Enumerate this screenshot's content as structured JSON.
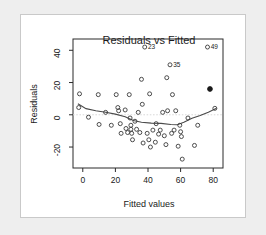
{
  "chart_data": {
    "type": "scatter",
    "title": "Residuals vs Fitted",
    "xlabel": "Fitted values",
    "ylabel": "Residuals",
    "xlim": [
      -6,
      86
    ],
    "ylim": [
      -33,
      47
    ],
    "xticks": [
      0,
      20,
      40,
      60,
      80
    ],
    "xticklabels": [
      "0",
      "20",
      "40",
      "60",
      "80"
    ],
    "yticks": [
      -20,
      0,
      20,
      40
    ],
    "yticklabels": [
      "-20",
      "0",
      "20",
      "40"
    ],
    "grid": false,
    "legend": null,
    "zero_reference_line": 0,
    "points": [
      {
        "x": -2.0,
        "y": 13.0
      },
      {
        "x": -2.5,
        "y": 4.5
      },
      {
        "x": 3.5,
        "y": -1.5
      },
      {
        "x": 9.5,
        "y": 12.5
      },
      {
        "x": 10.0,
        "y": -6.0
      },
      {
        "x": 14.0,
        "y": 1.5
      },
      {
        "x": 17.5,
        "y": -6.5
      },
      {
        "x": 20.5,
        "y": 12.5
      },
      {
        "x": 21.5,
        "y": 4.5
      },
      {
        "x": 22.0,
        "y": 2.5
      },
      {
        "x": 23.0,
        "y": -5.5
      },
      {
        "x": 23.5,
        "y": -11.5
      },
      {
        "x": 26.0,
        "y": 3.0
      },
      {
        "x": 26.5,
        "y": -8.5
      },
      {
        "x": 27.5,
        "y": -11.0
      },
      {
        "x": 28.5,
        "y": 12.5
      },
      {
        "x": 29.0,
        "y": -2.0
      },
      {
        "x": 29.5,
        "y": -6.5
      },
      {
        "x": 29.5,
        "y": -9.0
      },
      {
        "x": 30.0,
        "y": -11.5
      },
      {
        "x": 30.5,
        "y": -15.5
      },
      {
        "x": 32.0,
        "y": -4.0
      },
      {
        "x": 33.0,
        "y": -9.0
      },
      {
        "x": 34.0,
        "y": 1.5
      },
      {
        "x": 35.0,
        "y": -11.0
      },
      {
        "x": 36.0,
        "y": 22.0
      },
      {
        "x": 36.5,
        "y": 6.5
      },
      {
        "x": 37.0,
        "y": -17.5
      },
      {
        "x": 38.0,
        "y": 42.0
      },
      {
        "x": 39.5,
        "y": -11.5
      },
      {
        "x": 40.5,
        "y": -15.5
      },
      {
        "x": 41.0,
        "y": 13.0
      },
      {
        "x": 41.5,
        "y": -20.0
      },
      {
        "x": 43.0,
        "y": -9.5
      },
      {
        "x": 44.5,
        "y": -17.0
      },
      {
        "x": 45.0,
        "y": -5.5
      },
      {
        "x": 46.5,
        "y": -12.0
      },
      {
        "x": 47.5,
        "y": -9.5
      },
      {
        "x": 49.0,
        "y": 1.5
      },
      {
        "x": 50.0,
        "y": -13.0
      },
      {
        "x": 51.0,
        "y": -18.5
      },
      {
        "x": 51.5,
        "y": 23.0
      },
      {
        "x": 52.0,
        "y": 2.5
      },
      {
        "x": 53.5,
        "y": 31.0
      },
      {
        "x": 54.5,
        "y": -11.5
      },
      {
        "x": 55.0,
        "y": 12.5
      },
      {
        "x": 56.0,
        "y": -9.5
      },
      {
        "x": 57.0,
        "y": 2.5
      },
      {
        "x": 58.5,
        "y": -19.5
      },
      {
        "x": 59.5,
        "y": -6.5
      },
      {
        "x": 60.0,
        "y": -10.5
      },
      {
        "x": 60.5,
        "y": -13.5
      },
      {
        "x": 61.0,
        "y": -27.5
      },
      {
        "x": 64.5,
        "y": -2.0
      },
      {
        "x": 68.5,
        "y": -19.0
      },
      {
        "x": 70.5,
        "y": -6.5
      },
      {
        "x": 76.5,
        "y": 42.0
      },
      {
        "x": 78.0,
        "y": 16.0
      },
      {
        "x": 81.0,
        "y": 4.0
      }
    ],
    "highlighted_point": {
      "x": 78.0,
      "y": 16.0
    },
    "labeled_points": [
      {
        "x": 38.0,
        "y": 42.0,
        "label": "23"
      },
      {
        "x": 53.5,
        "y": 31.0,
        "label": "35"
      },
      {
        "x": 76.5,
        "y": 42.0,
        "label": "49"
      }
    ],
    "smooth_curve": [
      {
        "x": -3.0,
        "y": 6.8
      },
      {
        "x": 2.0,
        "y": 3.8
      },
      {
        "x": 8.0,
        "y": 2.5
      },
      {
        "x": 14.0,
        "y": 1.6
      },
      {
        "x": 20.0,
        "y": 0.4
      },
      {
        "x": 26.0,
        "y": -1.2
      },
      {
        "x": 31.0,
        "y": -3.6
      },
      {
        "x": 36.0,
        "y": -4.6
      },
      {
        "x": 42.0,
        "y": -5.2
      },
      {
        "x": 48.0,
        "y": -5.3
      },
      {
        "x": 54.0,
        "y": -6.0
      },
      {
        "x": 58.0,
        "y": -6.2
      },
      {
        "x": 62.0,
        "y": -4.6
      },
      {
        "x": 67.0,
        "y": -2.2
      },
      {
        "x": 72.0,
        "y": -0.4
      },
      {
        "x": 77.0,
        "y": 1.6
      },
      {
        "x": 82.0,
        "y": 4.0
      }
    ]
  }
}
